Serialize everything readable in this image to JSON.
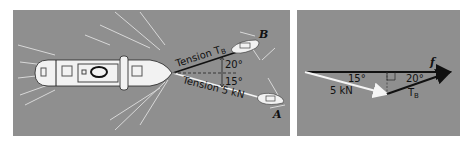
{
  "figure": {
    "left_panel": {
      "description": "Ship towed by two tugboats A and B",
      "labels": {
        "tension_b": "Tension T",
        "tension_b_sub": "B",
        "tension_a": "Tension 5 kN",
        "angle_b": "20°",
        "angle_a": "15°",
        "tug_b": "B",
        "tug_a": "A"
      }
    },
    "right_panel": {
      "description": "Force triangle",
      "labels": {
        "resultant": "f",
        "angle_a": "15°",
        "angle_b": "20°",
        "force_a": "5 kN",
        "force_b": "T",
        "force_b_sub": "B"
      }
    },
    "colors": {
      "background": "#8f8f8f",
      "ship": "#f2f2f2",
      "rope_b": "#111111",
      "rope_a": "#f5f5f5",
      "wake": "#d9d9d9"
    }
  }
}
